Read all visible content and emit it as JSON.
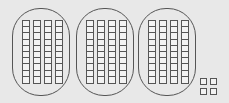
{
  "diagram": {
    "type": "base-ten-blocks",
    "groups": [
      {
        "rods": 4,
        "cells_per_rod": 10
      },
      {
        "rods": 4,
        "cells_per_rod": 10
      },
      {
        "rods": 4,
        "cells_per_rod": 10
      }
    ],
    "units": 4,
    "colors": {
      "background": "#e8e8e8",
      "stroke": "#555555"
    }
  }
}
